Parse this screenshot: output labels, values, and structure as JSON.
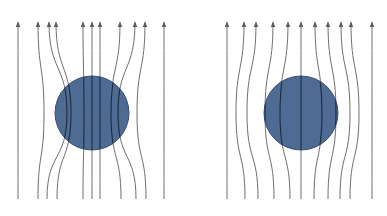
{
  "figure": {
    "colors": {
      "background": "#ffffff",
      "sphere_fill": "#4d6b93",
      "sphere_stroke": "#3a4f6b",
      "line": "#6e6e6e",
      "line_inside": "#1e2a3c"
    },
    "panels": [
      {
        "id": "left",
        "name": "field-lines-concentrated",
        "sphere": {
          "cx": 92,
          "cy": 113,
          "r": 37
        },
        "y_top": 22,
        "y_bottom": 199,
        "lines": [
          {
            "top": 18,
            "mid": 18,
            "bottom": 18
          },
          {
            "top": 38,
            "mid": 44,
            "bottom": 38
          },
          {
            "top": 49,
            "mid": 67,
            "bottom": 47
          },
          {
            "top": 56,
            "mid": 71,
            "bottom": 57
          },
          {
            "top": 83,
            "mid": 84,
            "bottom": 83
          },
          {
            "top": 92,
            "mid": 92,
            "bottom": 92
          },
          {
            "top": 100,
            "mid": 100,
            "bottom": 100
          },
          {
            "top": 120,
            "mid": 111,
            "bottom": 121
          },
          {
            "top": 135,
            "mid": 118,
            "bottom": 136
          },
          {
            "top": 145,
            "mid": 137,
            "bottom": 146
          },
          {
            "top": 164,
            "mid": 164,
            "bottom": 164
          }
        ]
      },
      {
        "id": "right",
        "name": "field-lines-expelled",
        "sphere": {
          "cx": 301,
          "cy": 113,
          "r": 37
        },
        "y_top": 22,
        "y_bottom": 199,
        "lines": [
          {
            "top": 227,
            "mid": 227,
            "bottom": 227
          },
          {
            "top": 244,
            "mid": 236,
            "bottom": 245
          },
          {
            "top": 256,
            "mid": 247,
            "bottom": 258
          },
          {
            "top": 273,
            "mid": 265,
            "bottom": 274
          },
          {
            "top": 288,
            "mid": 280,
            "bottom": 290
          },
          {
            "top": 301,
            "mid": 301,
            "bottom": 301
          },
          {
            "top": 315,
            "mid": 322,
            "bottom": 314
          },
          {
            "top": 328,
            "mid": 336,
            "bottom": 328
          },
          {
            "top": 341,
            "mid": 350,
            "bottom": 340
          },
          {
            "top": 351,
            "mid": 359,
            "bottom": 350
          },
          {
            "top": 372,
            "mid": 372,
            "bottom": 372
          }
        ]
      }
    ]
  }
}
